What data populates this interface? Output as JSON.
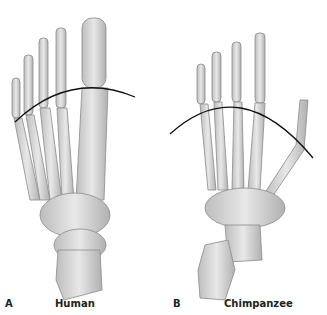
{
  "figure": {
    "panels": [
      {
        "letter": "A",
        "caption": "Human"
      },
      {
        "letter": "B",
        "caption": "Chimpanzee"
      }
    ]
  },
  "colors": {
    "bone_fill": "#d6d6d6",
    "bone_stroke": "#8a8a8a",
    "arc": "#111111"
  }
}
